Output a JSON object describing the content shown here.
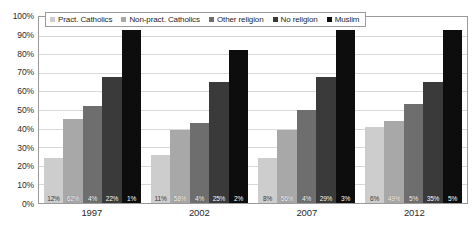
{
  "chart_data": {
    "type": "bar",
    "title": "",
    "subtitle": "",
    "xlabel": "",
    "ylabel": "",
    "categories": [
      "1997",
      "2002",
      "2007",
      "2012"
    ],
    "ylim": [
      0,
      100
    ],
    "ytick_labels": [
      "100%",
      "90%",
      "80%",
      "70%",
      "60%",
      "50%",
      "40%",
      "30%",
      "20%",
      "10%",
      "0%"
    ],
    "ytick_values": [
      100,
      90,
      80,
      70,
      60,
      50,
      40,
      30,
      20,
      10,
      0
    ],
    "grid": true,
    "legend_position": "top-inside",
    "series": [
      {
        "name": "Pract. Catholics",
        "color": "#cdcdcd",
        "values": [
          24,
          26,
          24,
          41
        ],
        "data_labels": [
          "12%",
          "11%",
          "8%",
          "6%"
        ]
      },
      {
        "name": "Non-pract. Catholics",
        "color": "#a8a8a8",
        "values": [
          45,
          39,
          39,
          44
        ],
        "data_labels": [
          "62%",
          "58%",
          "56%",
          "49%"
        ]
      },
      {
        "name": "Other religion",
        "color": "#6e6e6e",
        "values": [
          52,
          43,
          50,
          53
        ],
        "data_labels": [
          "4%",
          "4%",
          "4%",
          "5%"
        ]
      },
      {
        "name": "No religion",
        "color": "#3a3a3a",
        "values": [
          68,
          65,
          68,
          65
        ],
        "data_labels": [
          "22%",
          "25%",
          "29%",
          "35%"
        ]
      },
      {
        "name": "Muslim",
        "color": "#0d0d0d",
        "values": [
          93,
          82,
          93,
          93
        ],
        "data_labels": [
          "1%",
          "2%",
          "3%",
          "5%"
        ]
      }
    ]
  }
}
